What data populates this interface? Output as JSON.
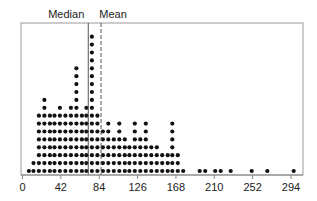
{
  "chart_data": {
    "type": "dot",
    "title": "",
    "xlabel": "",
    "ylabel": "",
    "xlim": [
      0,
      304
    ],
    "x_ticks": [
      0,
      42,
      84,
      126,
      168,
      210,
      252,
      294
    ],
    "annotations": [
      {
        "label": "Median",
        "x": 72,
        "style": "solid"
      },
      {
        "label": "Mean",
        "x": 86,
        "style": "dashed"
      }
    ],
    "columns": [
      {
        "x": 7,
        "count": 1
      },
      {
        "x": 12,
        "count": 2
      },
      {
        "x": 18,
        "count": 8
      },
      {
        "x": 24,
        "count": 10
      },
      {
        "x": 30,
        "count": 8
      },
      {
        "x": 35,
        "count": 8
      },
      {
        "x": 41,
        "count": 9
      },
      {
        "x": 47,
        "count": 8
      },
      {
        "x": 53,
        "count": 9
      },
      {
        "x": 59,
        "count": 14
      },
      {
        "x": 65,
        "count": 8
      },
      {
        "x": 70,
        "count": 9
      },
      {
        "x": 76,
        "count": 18
      },
      {
        "x": 82,
        "count": 8
      },
      {
        "x": 88,
        "count": 6
      },
      {
        "x": 94,
        "count": 7
      },
      {
        "x": 100,
        "count": 5
      },
      {
        "x": 106,
        "count": 7
      },
      {
        "x": 112,
        "count": 5
      },
      {
        "x": 117,
        "count": 4
      },
      {
        "x": 123,
        "count": 7
      },
      {
        "x": 129,
        "count": 5
      },
      {
        "x": 135,
        "count": 7
      },
      {
        "x": 141,
        "count": 4
      },
      {
        "x": 147,
        "count": 4
      },
      {
        "x": 153,
        "count": 3
      },
      {
        "x": 159,
        "count": 3
      },
      {
        "x": 164,
        "count": 7
      },
      {
        "x": 170,
        "count": 3
      },
      {
        "x": 176,
        "count": 1
      },
      {
        "x": 194,
        "count": 1
      },
      {
        "x": 200,
        "count": 1
      },
      {
        "x": 211,
        "count": 1
      },
      {
        "x": 217,
        "count": 1
      },
      {
        "x": 228,
        "count": 1
      },
      {
        "x": 251,
        "count": 1
      },
      {
        "x": 268,
        "count": 1
      },
      {
        "x": 297,
        "count": 1
      }
    ],
    "grid": false,
    "legend": null
  },
  "labels": {
    "median": "Median",
    "mean": "Mean",
    "ticks": [
      "0",
      "42",
      "84",
      "126",
      "168",
      "210",
      "252",
      "294"
    ]
  }
}
